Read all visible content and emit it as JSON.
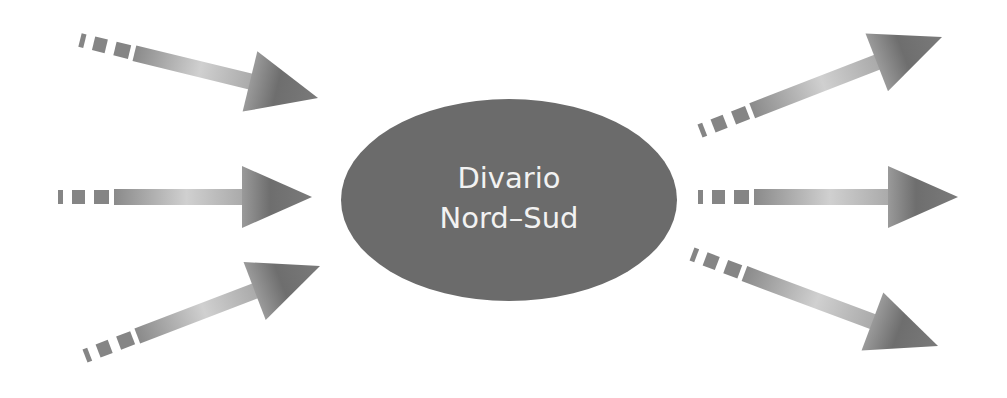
{
  "diagram": {
    "central_node": {
      "line1": "Divario",
      "line2": "Nord–Sud",
      "fill": "#6b6b6b",
      "text_color": "#f2f2f2"
    },
    "arrow_color": "#7a7a7a",
    "arrow_light": "#d4d4d4",
    "incoming_arrows": [
      {
        "id": "in-top",
        "from": [
          80,
          40
        ],
        "to": [
          318,
          98
        ]
      },
      {
        "id": "in-middle",
        "from": [
          58,
          197
        ],
        "to": [
          312,
          197
        ]
      },
      {
        "id": "in-bottom",
        "from": [
          85,
          356
        ],
        "to": [
          320,
          266
        ]
      }
    ],
    "outgoing_arrows": [
      {
        "id": "out-top",
        "from": [
          700,
          131
        ],
        "to": [
          942,
          37
        ]
      },
      {
        "id": "out-middle",
        "from": [
          698,
          197
        ],
        "to": [
          958,
          197
        ]
      },
      {
        "id": "out-bottom",
        "from": [
          692,
          254
        ],
        "to": [
          938,
          346
        ]
      }
    ]
  }
}
